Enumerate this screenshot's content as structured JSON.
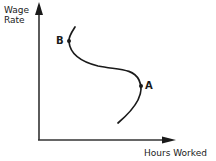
{
  "diagram": {
    "type": "labor-supply-curve",
    "y_axis_label_line1": "Wage",
    "y_axis_label_line2": "Rate",
    "x_axis_label": "Hours Worked",
    "points": [
      {
        "label": "B",
        "x": 69,
        "y": 41
      },
      {
        "label": "A",
        "x": 141,
        "y": 86
      }
    ],
    "colors": {
      "line": "#1a1a1a",
      "axis": "#333333",
      "background": "#ffffff"
    }
  }
}
